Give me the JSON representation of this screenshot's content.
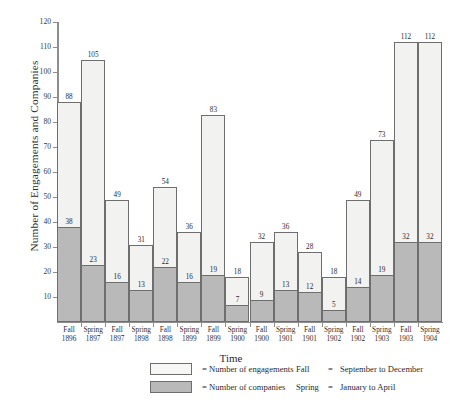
{
  "chart_data": {
    "type": "bar",
    "title": "",
    "xlabel": "Time",
    "ylabel": "Number of Engagements and Companies",
    "ylim": [
      0,
      120
    ],
    "ytick_step": 10,
    "yticks": [
      10,
      20,
      30,
      40,
      50,
      60,
      70,
      80,
      90,
      100,
      110,
      120
    ],
    "grid": false,
    "legend_position": "below-left",
    "categories": [
      "Fall 1896",
      "Spring 1897",
      "Fall 1897",
      "Spring 1898",
      "Fall 1898",
      "Spring 1899",
      "Fall 1899",
      "Spring 1900",
      "Fall 1900",
      "Spring 1901",
      "Fall 1901",
      "Spring 1902",
      "Fall 1902",
      "Spring 1903",
      "Fall 1903",
      "Spring 1904"
    ],
    "category_season": [
      "Fall",
      "Spring",
      "Fall",
      "Spring",
      "Fall",
      "Spring",
      "Fall",
      "Spring",
      "Fall",
      "Spring",
      "Fall",
      "Spring",
      "Fall",
      "Spring",
      "Fall",
      "Spring"
    ],
    "category_year": [
      "1896",
      "1897",
      "1897",
      "1898",
      "1898",
      "1899",
      "1899",
      "1900",
      "1900",
      "1901",
      "1901",
      "1902",
      "1902",
      "1903",
      "1903",
      "1904"
    ],
    "series": [
      {
        "name": "Number of engagements",
        "color": "#f2f2f0",
        "values": [
          88,
          105,
          49,
          31,
          54,
          36,
          83,
          18,
          32,
          36,
          28,
          18,
          49,
          73,
          112,
          112
        ]
      },
      {
        "name": "Number of companies",
        "color": "#b9b9b9",
        "values": [
          38,
          23,
          16,
          13,
          22,
          16,
          19,
          7,
          9,
          13,
          12,
          5,
          14,
          19,
          32,
          32
        ]
      }
    ]
  },
  "axes": {
    "ylabel": "Number of Engagements and Companies",
    "xlabel": "Time"
  },
  "legend": {
    "items": [
      {
        "swatch": "engagements-swatch",
        "equals": "=",
        "label": "= Number of engagements"
      },
      {
        "swatch": "companies-swatch",
        "equals": "=",
        "label": "= Number of companies"
      }
    ]
  },
  "notes": {
    "rows": [
      {
        "key": "Fall",
        "eq": "=",
        "value": "September to December"
      },
      {
        "key": "Spring",
        "eq": "=",
        "value": "January to April"
      }
    ]
  },
  "caption": ""
}
